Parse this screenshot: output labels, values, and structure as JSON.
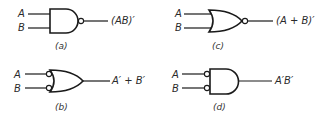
{
  "gates": [
    {
      "id": "a",
      "type": "NAND",
      "inputs": [
        "A",
        "B"
      ],
      "output": "(AB)′",
      "caption": "(a)"
    },
    {
      "id": "b",
      "type": "OR with inverted inputs",
      "inputs": [
        "A",
        "B"
      ],
      "output": "A′ + B′",
      "caption": "(b)"
    },
    {
      "id": "c",
      "type": "NOR",
      "inputs": [
        "A",
        "B"
      ],
      "output": "(A + B)′",
      "caption": "(c)"
    },
    {
      "id": "d",
      "type": "AND with inverted inputs",
      "inputs": [
        "A",
        "B"
      ],
      "output": "A′B′",
      "caption": "(d)"
    }
  ]
}
